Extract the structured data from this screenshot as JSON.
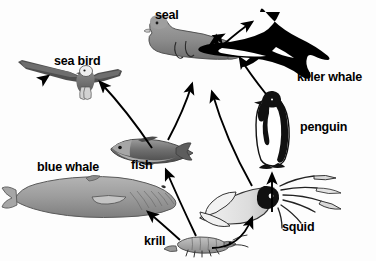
{
  "diagram": {
    "type": "food-web",
    "background_color": "#fdfdfd",
    "arrow_color": "#000000"
  },
  "organisms": [
    {
      "id": "seal",
      "label": "seal",
      "icon": "seal-icon",
      "fill": "#8f8f8f",
      "x": 155,
      "y": 9
    },
    {
      "id": "sea_bird",
      "label": "sea bird",
      "icon": "sea-bird-icon",
      "fill": "#6b6b6b",
      "x": 54,
      "y": 55
    },
    {
      "id": "killer_whale",
      "label": "killer whale",
      "icon": "killer-whale-icon",
      "fill": "#000000",
      "x": 297,
      "y": 71
    },
    {
      "id": "penguin",
      "label": "penguin",
      "icon": "penguin-icon",
      "fill": "#000000",
      "x": 300,
      "y": 121
    },
    {
      "id": "blue_whale",
      "label": "blue whale",
      "icon": "blue-whale-icon",
      "fill": "#9a9a9a",
      "x": 37,
      "y": 161
    },
    {
      "id": "fish",
      "label": "fish",
      "icon": "fish-icon",
      "fill": "#7d7d7d",
      "x": 131,
      "y": 159
    },
    {
      "id": "squid",
      "label": "squid",
      "icon": "squid-icon",
      "fill": "#e8e8e8",
      "x": 282,
      "y": 221
    },
    {
      "id": "krill",
      "label": "krill",
      "icon": "krill-icon",
      "fill": "#a8a8a8",
      "x": 144,
      "y": 235
    }
  ],
  "arrows": [
    {
      "from": "fish",
      "to": "sea_bird",
      "name": "arrow-fish-to-sea-bird"
    },
    {
      "from": "fish",
      "to": "seal",
      "name": "arrow-fish-to-seal"
    },
    {
      "from": "krill",
      "to": "blue_whale",
      "name": "arrow-krill-to-blue-whale"
    },
    {
      "from": "krill",
      "to": "fish",
      "name": "arrow-krill-to-fish"
    },
    {
      "from": "krill",
      "to": "squid",
      "name": "arrow-krill-to-squid"
    },
    {
      "from": "squid",
      "to": "penguin",
      "name": "arrow-squid-to-penguin"
    },
    {
      "from": "squid",
      "to": "seal",
      "name": "arrow-squid-to-seal"
    },
    {
      "from": "seal",
      "to": "killer_whale",
      "name": "arrow-seal-to-killer-whale"
    },
    {
      "from": "penguin",
      "to": "killer_whale",
      "name": "arrow-penguin-to-killer-whale"
    },
    {
      "from": "blue_whale",
      "to": "killer_whale",
      "name": "arrow-blue-whale-to-killer-whale"
    }
  ]
}
